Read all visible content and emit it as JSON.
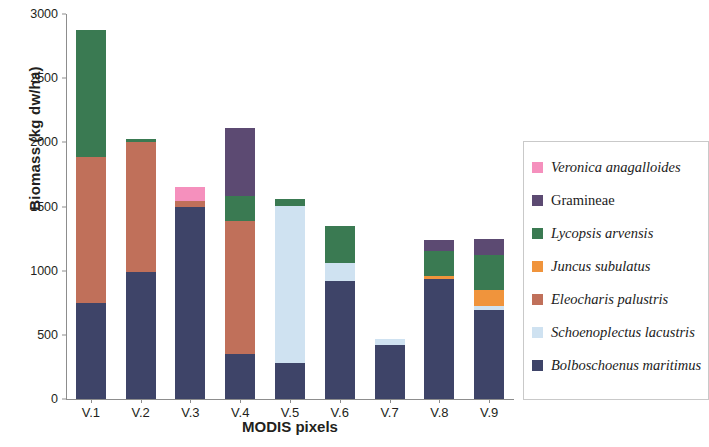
{
  "chart_data": {
    "type": "bar",
    "stacked": true,
    "title": "",
    "xlabel": "MODIS pixels",
    "ylabel": "Biomass (kg dw/ha)",
    "ylim": [
      0,
      3000
    ],
    "yticks": [
      0,
      500,
      1000,
      1500,
      2000,
      2500,
      3000
    ],
    "grid": false,
    "legend_position": "right",
    "categories": [
      "V.1",
      "V.2",
      "V.3",
      "V.4",
      "V.5",
      "V.6",
      "V.7",
      "V.8",
      "V.9"
    ],
    "series": [
      {
        "name": "Bolboschoenus maritimus",
        "color": "#3e4468",
        "values": [
          748,
          990,
          1500,
          350,
          280,
          920,
          420,
          935,
          690
        ]
      },
      {
        "name": "Schoenoplectus lacustris",
        "color": "#cfe2f1",
        "values": [
          0,
          0,
          0,
          0,
          1225,
          140,
          45,
          0,
          35
        ]
      },
      {
        "name": "Eleocharis palustris",
        "color": "#c0705a",
        "values": [
          1140,
          1015,
          45,
          1040,
          0,
          0,
          0,
          0,
          0
        ]
      },
      {
        "name": "Juncus subulatus",
        "color": "#f0943c",
        "values": [
          0,
          0,
          0,
          0,
          0,
          0,
          0,
          20,
          125
        ]
      },
      {
        "name": "Lycopsis arvensis",
        "color": "#3a7a52",
        "values": [
          990,
          20,
          0,
          190,
          55,
          290,
          0,
          195,
          270
        ]
      },
      {
        "name": "Gramineae",
        "color": "#5c4a72",
        "values": [
          0,
          0,
          0,
          530,
          0,
          0,
          0,
          90,
          130
        ]
      },
      {
        "name": "Veronica anagalloides",
        "color": "#f590bd",
        "values": [
          0,
          0,
          110,
          0,
          0,
          0,
          0,
          0,
          0
        ]
      }
    ],
    "totals": [
      2878,
      2025,
      1655,
      2110,
      1560,
      1350,
      465,
      1240,
      1250
    ]
  },
  "legend": {
    "items": [
      {
        "label": "Veronica anagalloides",
        "color": "#f590bd",
        "italic": true
      },
      {
        "label": "Gramineae",
        "color": "#5c4a72",
        "italic": false
      },
      {
        "label": "Lycopsis arvensis",
        "color": "#3a7a52",
        "italic": true
      },
      {
        "label": "Juncus subulatus",
        "color": "#f0943c",
        "italic": true
      },
      {
        "label": "Eleocharis palustris",
        "color": "#c0705a",
        "italic": true
      },
      {
        "label": "Schoenoplectus lacustris",
        "color": "#cfe2f1",
        "italic": true
      },
      {
        "label": "Bolboschoenus maritimus",
        "color": "#3e4468",
        "italic": true
      }
    ]
  }
}
